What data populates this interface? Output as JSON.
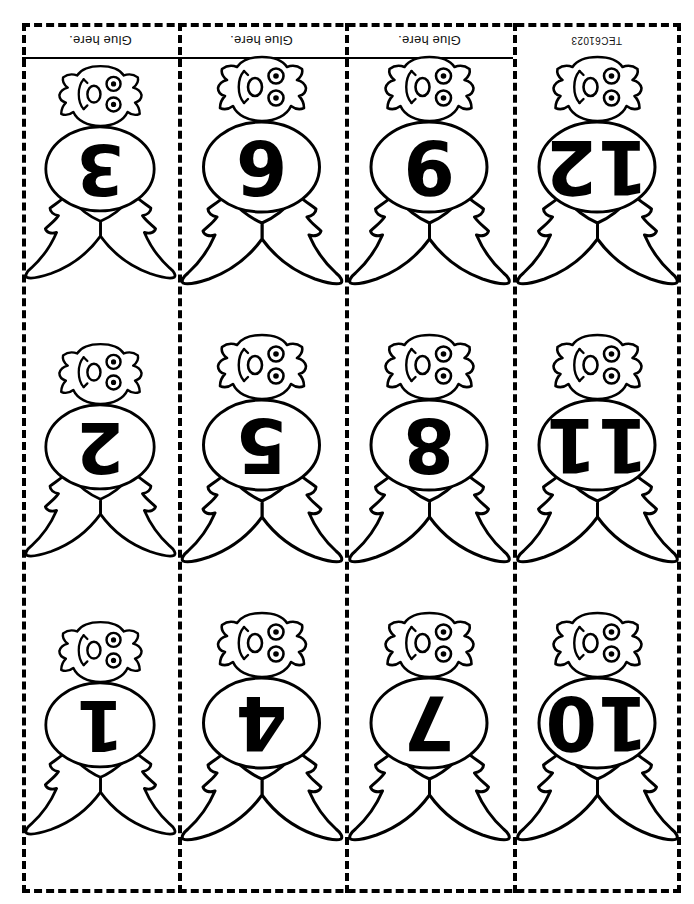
{
  "page": {
    "code": "TEC61023",
    "ink_color": "#000000",
    "paper_color": "#ffffff",
    "orientation_note": "rotated-180"
  },
  "glue_tabs": [
    {
      "label": "Glue here."
    },
    {
      "label": "Glue here."
    },
    {
      "label": "Glue here."
    }
  ],
  "columns": [
    {
      "index": 1
    },
    {
      "index": 2
    },
    {
      "index": 3
    },
    {
      "index": 4
    }
  ],
  "bats": [
    {
      "row": 1,
      "col": 1,
      "number": "3"
    },
    {
      "row": 1,
      "col": 2,
      "number": "6"
    },
    {
      "row": 1,
      "col": 3,
      "number": "9"
    },
    {
      "row": 1,
      "col": 4,
      "number": "12"
    },
    {
      "row": 2,
      "col": 1,
      "number": "2"
    },
    {
      "row": 2,
      "col": 2,
      "number": "5"
    },
    {
      "row": 2,
      "col": 3,
      "number": "8"
    },
    {
      "row": 2,
      "col": 4,
      "number": "11"
    },
    {
      "row": 3,
      "col": 1,
      "number": "1"
    },
    {
      "row": 3,
      "col": 2,
      "number": "4"
    },
    {
      "row": 3,
      "col": 3,
      "number": "7"
    },
    {
      "row": 3,
      "col": 4,
      "number": "10"
    }
  ]
}
